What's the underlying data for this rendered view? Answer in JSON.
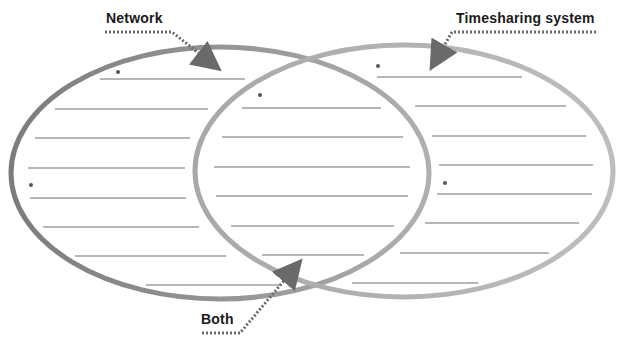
{
  "diagram": {
    "type": "venn",
    "title": "",
    "regions": [
      {
        "key": "left",
        "label": "Network",
        "bullet_count": 2,
        "line_count": 8
      },
      {
        "key": "overlap",
        "label": "Both",
        "bullet_count": 1,
        "line_count": 6
      },
      {
        "key": "right",
        "label": "Timesharing system",
        "bullet_count": 2,
        "line_count": 8
      }
    ],
    "colors": {
      "left_circle": "#8a8a8a",
      "right_circle": "#ababab",
      "writing_line": "#6e6e6e",
      "arrow": "#6a6a6a",
      "label_text": "#1a1a1a",
      "bullet": "#555555"
    }
  },
  "labels": {
    "network": "Network",
    "timesharing": "Timesharing system",
    "both": "Both"
  }
}
